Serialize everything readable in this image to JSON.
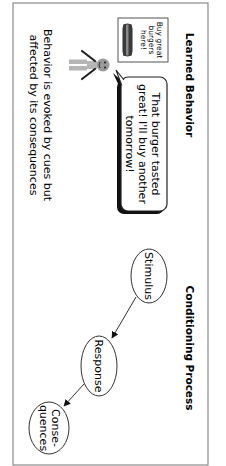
{
  "orientation": "rotated-90-clockwise",
  "panels": {
    "learned": {
      "heading": "Learned Behavior",
      "sign": {
        "lines": [
          "Buy great",
          "burgers",
          "here!"
        ],
        "icon": "burger-icon"
      },
      "figure": {
        "icon": "stick-figure-icon",
        "head_color": "#9a9a9a",
        "body_color": "#b5b5b5"
      },
      "speech_bubble": {
        "lines": [
          "That burger tasted",
          "great! I'll buy another",
          "tomorrow!"
        ]
      },
      "caption": {
        "lines": [
          "Behavior is evoked by cues but",
          "affected by its consequences"
        ]
      }
    },
    "conditioning": {
      "heading": "Conditioning Process",
      "nodes": [
        {
          "id": "stimulus",
          "lines": [
            "Stimulus"
          ]
        },
        {
          "id": "response",
          "lines": [
            "Response"
          ]
        },
        {
          "id": "consequences",
          "lines": [
            "Conse-",
            "quences"
          ]
        }
      ],
      "edges": [
        {
          "from": "stimulus",
          "to": "response"
        },
        {
          "from": "response",
          "to": "consequences"
        }
      ]
    }
  },
  "colors": {
    "frame": "#8a8a8a",
    "stroke": "#222222",
    "shadow": "#111111",
    "burger_dark": "#3a3a3a",
    "burger_mid": "#8a8a8a"
  }
}
